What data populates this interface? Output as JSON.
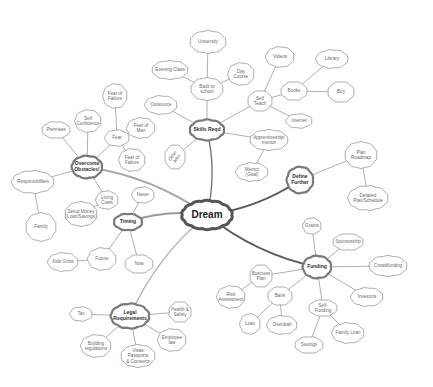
{
  "diagram": {
    "type": "mind-map",
    "root": {
      "id": "dream",
      "label": "Dream",
      "x": 207,
      "y": 215,
      "w": 52,
      "h": 30
    },
    "branches": [
      {
        "id": "skills",
        "label": "Skills Reqd",
        "x": 207,
        "y": 130,
        "w": 36,
        "h": 22
      },
      {
        "id": "define",
        "label": "Define\nFurther",
        "x": 300,
        "y": 180,
        "w": 28,
        "h": 28
      },
      {
        "id": "funding",
        "label": "Funding",
        "x": 317,
        "y": 267,
        "w": 30,
        "h": 24
      },
      {
        "id": "legal",
        "label": "Legal\nRequirements",
        "x": 130,
        "y": 316,
        "w": 40,
        "h": 26
      },
      {
        "id": "timing",
        "label": "Timing",
        "x": 128,
        "y": 222,
        "w": 30,
        "h": 18
      },
      {
        "id": "obstacles",
        "label": "Overcome\nObstacles!",
        "x": 87,
        "y": 167,
        "w": 32,
        "h": 24
      }
    ],
    "leaves": [
      {
        "id": "university",
        "label": "University",
        "x": 208,
        "y": 42,
        "w": 38,
        "h": 24,
        "parent": "back_school"
      },
      {
        "id": "back_school",
        "label": "Back to\nschool",
        "x": 207,
        "y": 89,
        "w": 34,
        "h": 24,
        "parent": "skills"
      },
      {
        "id": "evening",
        "label": "Evening Class",
        "x": 170,
        "y": 70,
        "w": 38,
        "h": 20,
        "parent": "back_school"
      },
      {
        "id": "day_course",
        "label": "Day\nCourse",
        "x": 241,
        "y": 74,
        "w": 28,
        "h": 24,
        "parent": "back_school"
      },
      {
        "id": "outsource",
        "label": "Outsource",
        "x": 161,
        "y": 105,
        "w": 34,
        "h": 20,
        "parent": "skills"
      },
      {
        "id": "other_jobs",
        "label": "Other\nJobs",
        "x": 175,
        "y": 157,
        "w": 22,
        "h": 26,
        "parent": "skills",
        "rotated": true
      },
      {
        "id": "self_teach",
        "label": "Self\nTeach",
        "x": 260,
        "y": 101,
        "w": 26,
        "h": 22,
        "parent": "skills"
      },
      {
        "id": "videos",
        "label": "Videos",
        "x": 280,
        "y": 57,
        "w": 30,
        "h": 22,
        "parent": "self_teach"
      },
      {
        "id": "books",
        "label": "Books",
        "x": 294,
        "y": 91,
        "w": 28,
        "h": 20,
        "parent": "self_teach"
      },
      {
        "id": "library",
        "label": "Library",
        "x": 332,
        "y": 59,
        "w": 34,
        "h": 20,
        "parent": "books"
      },
      {
        "id": "buy",
        "label": "Buy",
        "x": 341,
        "y": 92,
        "w": 28,
        "h": 22,
        "parent": "books"
      },
      {
        "id": "internet",
        "label": "Internet",
        "x": 299,
        "y": 121,
        "w": 28,
        "h": 16,
        "parent": "self_teach"
      },
      {
        "id": "apprenticeship",
        "label": "Apprenticeship/\nmentor",
        "x": 269,
        "y": 140,
        "w": 40,
        "h": 22,
        "parent": "skills"
      },
      {
        "id": "mentor",
        "label": "Mentor (Goal)",
        "x": 252,
        "y": 172,
        "w": 34,
        "h": 20,
        "parent": "apprenticeship"
      },
      {
        "id": "plan_roadmap",
        "label": "Plan\nRoadmap",
        "x": 361,
        "y": 155,
        "w": 34,
        "h": 28,
        "parent": "define"
      },
      {
        "id": "detailed_plan",
        "label": "Detailed\nPlan/Schedule",
        "x": 368,
        "y": 198,
        "w": 42,
        "h": 26,
        "parent": "plan_roadmap"
      },
      {
        "id": "grants",
        "label": "Grants",
        "x": 312,
        "y": 226,
        "w": 20,
        "h": 18,
        "parent": "funding"
      },
      {
        "id": "sponsorship",
        "label": "Sponsorship",
        "x": 348,
        "y": 242,
        "w": 32,
        "h": 18,
        "parent": "funding"
      },
      {
        "id": "crowdfunding",
        "label": "Crowdfunding",
        "x": 388,
        "y": 266,
        "w": 40,
        "h": 22,
        "parent": "funding"
      },
      {
        "id": "investors",
        "label": "Investors",
        "x": 367,
        "y": 297,
        "w": 34,
        "h": 20,
        "parent": "funding"
      },
      {
        "id": "self_funding",
        "label": "Self-Funding",
        "x": 323,
        "y": 308,
        "w": 30,
        "h": 18,
        "parent": "funding"
      },
      {
        "id": "family_loan",
        "label": "Family Loan",
        "x": 348,
        "y": 333,
        "w": 34,
        "h": 22,
        "parent": "self_funding"
      },
      {
        "id": "savings",
        "label": "Savings",
        "x": 309,
        "y": 345,
        "w": 30,
        "h": 18,
        "parent": "self_funding"
      },
      {
        "id": "business_plan",
        "label": "Business\nPlan",
        "x": 261,
        "y": 276,
        "w": 24,
        "h": 24,
        "parent": "funding"
      },
      {
        "id": "risk_assessment",
        "label": "Risk\nAssessment",
        "x": 231,
        "y": 297,
        "w": 30,
        "h": 24,
        "parent": "business_plan"
      },
      {
        "id": "bank",
        "label": "Bank",
        "x": 280,
        "y": 296,
        "w": 26,
        "h": 20,
        "parent": "funding"
      },
      {
        "id": "loan",
        "label": "Loan",
        "x": 250,
        "y": 324,
        "w": 22,
        "h": 22,
        "parent": "bank"
      },
      {
        "id": "overdraft",
        "label": "Overdraft",
        "x": 282,
        "y": 325,
        "w": 32,
        "h": 20,
        "parent": "bank"
      },
      {
        "id": "fear_failure",
        "label": "Fear of\nFailure",
        "x": 115,
        "y": 96,
        "w": 26,
        "h": 26,
        "parent": "fear"
      },
      {
        "id": "self_confidence",
        "label": "Self\nConfidence",
        "x": 88,
        "y": 121,
        "w": 28,
        "h": 24,
        "parent": "obstacles"
      },
      {
        "id": "premises",
        "label": "Premises",
        "x": 56,
        "y": 130,
        "w": 30,
        "h": 18,
        "parent": "obstacles"
      },
      {
        "id": "fear",
        "label": "Fear",
        "x": 117,
        "y": 138,
        "w": 26,
        "h": 18,
        "parent": "obstacles"
      },
      {
        "id": "fear_man",
        "label": "Fear of\nMan",
        "x": 141,
        "y": 128,
        "w": 30,
        "h": 22,
        "parent": "fear"
      },
      {
        "id": "fear_failure2",
        "label": "Fear of\nFailure",
        "x": 132,
        "y": 160,
        "w": 28,
        "h": 24,
        "parent": "fear"
      },
      {
        "id": "responsibilities",
        "label": "Responsibilities",
        "x": 33,
        "y": 182,
        "w": 44,
        "h": 24,
        "parent": "obstacles"
      },
      {
        "id": "family",
        "label": "Family",
        "x": 41,
        "y": 227,
        "w": 32,
        "h": 30,
        "parent": "responsibilities"
      },
      {
        "id": "living_costs",
        "label": "Living\nCosts",
        "x": 107,
        "y": 200,
        "w": 24,
        "h": 20,
        "parent": "obstacles"
      },
      {
        "id": "setup_money",
        "label": "Setup Money\n(Loan/Savings)",
        "x": 81,
        "y": 214,
        "w": 34,
        "h": 26,
        "parent": "living_costs"
      },
      {
        "id": "never",
        "label": "Never",
        "x": 143,
        "y": 195,
        "w": 24,
        "h": 18,
        "parent": "timing"
      },
      {
        "id": "future",
        "label": "Future",
        "x": 102,
        "y": 259,
        "w": 30,
        "h": 24,
        "parent": "timing"
      },
      {
        "id": "now",
        "label": "Now",
        "x": 139,
        "y": 264,
        "w": 30,
        "h": 20,
        "parent": "timing"
      },
      {
        "id": "kids_grow",
        "label": "Kids Grow",
        "x": 63,
        "y": 262,
        "w": 32,
        "h": 20,
        "parent": "future"
      },
      {
        "id": "tax",
        "label": "Tax",
        "x": 81,
        "y": 314,
        "w": 24,
        "h": 16,
        "parent": "legal"
      },
      {
        "id": "health_safety",
        "label": "Health &\nSafety",
        "x": 180,
        "y": 312,
        "w": 24,
        "h": 22,
        "parent": "legal"
      },
      {
        "id": "building_regs",
        "label": "Building\nregulations",
        "x": 96,
        "y": 346,
        "w": 32,
        "h": 24,
        "parent": "legal"
      },
      {
        "id": "employee_law",
        "label": "Employee\nlaw",
        "x": 172,
        "y": 340,
        "w": 30,
        "h": 24,
        "parent": "legal"
      },
      {
        "id": "visas",
        "label": "Visas Passports\n& Consents",
        "x": 138,
        "y": 356,
        "w": 36,
        "h": 24,
        "parent": "legal"
      }
    ],
    "trunk_links": [
      {
        "from": "dream",
        "to": "skills",
        "color": "#6e6e6e",
        "width": 1.3
      },
      {
        "from": "dream",
        "to": "define",
        "color": "#5a5a5a",
        "width": 2.0
      },
      {
        "from": "dream",
        "to": "funding",
        "color": "#5e5e5e",
        "width": 2.0
      },
      {
        "from": "dream",
        "to": "timing",
        "color": "#9a9a9a",
        "width": 2.0
      },
      {
        "from": "dream",
        "to": "obstacles",
        "color": "#a8a8a8",
        "width": 2.2
      },
      {
        "from": "dream",
        "to": "legal",
        "color": "#b5b5b5",
        "width": 1.4
      }
    ],
    "colors": {
      "root_outline": "#555555",
      "branch_outline": "#7a7a7a",
      "leaf_outline": "#8a8a8a",
      "leaf_text": "#6a6a6a",
      "link": "#8c8c8c",
      "background": "#ffffff"
    }
  }
}
